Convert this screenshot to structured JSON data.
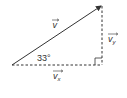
{
  "diagram": {
    "vector": {
      "label": "v",
      "has_arrow_over": true
    },
    "vertical_component": {
      "label": "v",
      "subscript": "y",
      "has_arrow_over": true,
      "style": "dashed"
    },
    "horizontal_component": {
      "label": "v",
      "subscript": "x",
      "has_arrow_over": true,
      "style": "dashed"
    },
    "angle": {
      "text": "33°",
      "value_degrees": 33
    },
    "right_angle_marker": true,
    "colors": {
      "line": "#333333",
      "text": "#333333",
      "background": "#ffffff"
    }
  }
}
